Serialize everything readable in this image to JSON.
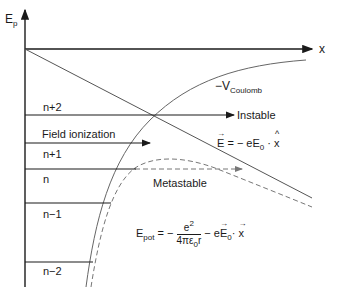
{
  "axes": {
    "y_label": "E",
    "y_label_sub": "p",
    "x_label": "x"
  },
  "levels": [
    {
      "label": "n+2"
    },
    {
      "label": "n+1"
    },
    {
      "label": "n"
    },
    {
      "label": "n−1"
    },
    {
      "label": "n−2"
    }
  ],
  "annotations": {
    "coulomb": "−V",
    "coulomb_sub": "Coulomb",
    "instable": "Instable",
    "field_ionization": "Field ionization",
    "metastable": "Metastable",
    "field_eq": {
      "lhs": "E",
      "eq": " = − eE",
      "sub0": "0",
      "dot": " · ",
      "x": "x"
    },
    "epot_eq": {
      "lhs": "E",
      "lhs_sub": "pot",
      "eq": " = −",
      "num": "e",
      "num_sup": "2",
      "den": "4πε",
      "den_sub": "0",
      "den_r": "r",
      "minus": " − e",
      "E": "E",
      "sub0": "0",
      "dot": "· ",
      "x": "x"
    }
  },
  "colors": {
    "line": "#2a2a2a",
    "curve": "#666666",
    "dashed": "#777777"
  }
}
